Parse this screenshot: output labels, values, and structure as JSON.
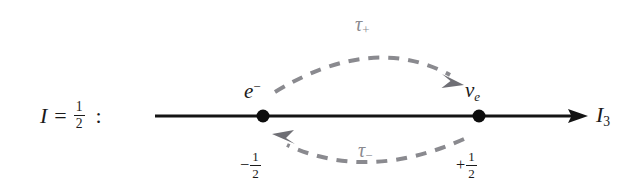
{
  "figure": {
    "type": "isospin-doublet-weight-diagram",
    "background_color": "#ffffff",
    "axis_color": "#141414",
    "arc_color": "#8a8a8f",
    "text_color": "#1a1a1a"
  },
  "left_label": {
    "symbol": "I",
    "equals": "=",
    "value_numerator": "1",
    "value_denominator": "2",
    "colon": ":"
  },
  "axis": {
    "label_symbol": "I",
    "label_subscript": "3",
    "start_x": 155,
    "end_x": 588,
    "y": 116
  },
  "states": [
    {
      "name": "electron",
      "symbol": "e",
      "superscript": "−",
      "value_sign": "−",
      "value_numerator": "1",
      "value_denominator": "2",
      "x": 263,
      "y": 116
    },
    {
      "name": "electron-neutrino",
      "symbol": "ν",
      "subscript": "e",
      "value_sign": "+",
      "value_numerator": "1",
      "value_denominator": "2",
      "x": 479,
      "y": 116
    }
  ],
  "operators": [
    {
      "name": "tau-plus",
      "symbol": "τ",
      "subscript": "+",
      "direction": "left-to-right",
      "position": "above-axis",
      "color": "#8a8a8f"
    },
    {
      "name": "tau-minus",
      "symbol": "τ",
      "subscript": "−",
      "direction": "right-to-left",
      "position": "below-axis",
      "color": "#8a8a8f"
    }
  ]
}
